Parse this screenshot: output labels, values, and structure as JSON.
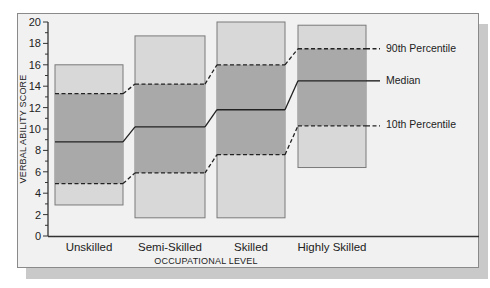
{
  "chart_data": {
    "type": "box-range",
    "title": "",
    "xlabel": "OCCUPATIONAL LEVEL",
    "ylabel": "VERBAL ABILITY SCORE",
    "ylim": [
      0,
      20
    ],
    "yticks": [
      0,
      2,
      4,
      6,
      8,
      10,
      12,
      14,
      16,
      18,
      20
    ],
    "grid": false,
    "categories": [
      "Unskilled",
      "Semi-Skilled",
      "Skilled",
      "Highly Skilled"
    ],
    "series": [
      {
        "name": "Maximum",
        "values": [
          16.0,
          18.7,
          20.0,
          19.7
        ]
      },
      {
        "name": "90th Percentile",
        "values": [
          13.3,
          14.2,
          16.0,
          17.5
        ]
      },
      {
        "name": "Median",
        "values": [
          8.8,
          10.2,
          11.8,
          14.5
        ]
      },
      {
        "name": "10th Percentile",
        "values": [
          4.9,
          5.9,
          7.6,
          10.3
        ]
      },
      {
        "name": "Minimum",
        "values": [
          2.9,
          1.7,
          1.7,
          6.4
        ]
      }
    ],
    "legend": {
      "position": "right",
      "entries": [
        "90th Percentile",
        "Median",
        "10th Percentile"
      ]
    },
    "colors": {
      "outer_range": "#d8d8d8",
      "inner_range": "#a9a9a9",
      "frame_bg": "#f1f1f1",
      "shadow": "#c9c9c9",
      "line": "#222222"
    }
  },
  "labels": {
    "legend_90": "90th Percentile",
    "legend_median": "Median",
    "legend_10": "10th Percentile",
    "xlabel": "OCCUPATIONAL LEVEL",
    "ylabel": "VERBAL ABILITY SCORE",
    "cat0": "Unskilled",
    "cat1": "Semi-Skilled",
    "cat2": "Skilled",
    "cat3": "Highly Skilled",
    "y0": "0",
    "y2": "2",
    "y4": "4",
    "y6": "6",
    "y8": "8",
    "y10": "10",
    "y12": "12",
    "y14": "14",
    "y16": "16",
    "y18": "18",
    "y20": "20"
  }
}
